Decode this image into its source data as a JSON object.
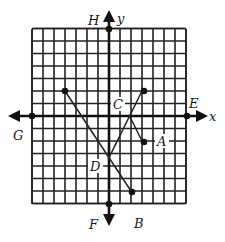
{
  "figure": {
    "type": "coordinate-grid-diagram",
    "grid": {
      "x_min": -7,
      "x_max": 7,
      "y_min": -7,
      "y_max": 7,
      "step": 1
    },
    "axes": {
      "x_label": "x",
      "y_label": "y"
    },
    "colors": {
      "ink": "#111111",
      "background": "#ffffff"
    }
  },
  "labels": {
    "H": "H",
    "y": "y",
    "G": "G",
    "x": "x",
    "E": "E",
    "C": "C",
    "A": "A",
    "D": "D",
    "F": "F",
    "B": "B"
  },
  "points": [
    {
      "name": "H",
      "x": 0,
      "y": 7
    },
    {
      "name": "F",
      "x": 0,
      "y": -7
    },
    {
      "name": "G",
      "x": -7,
      "y": 0
    },
    {
      "name": "E",
      "x": 7,
      "y": 0
    },
    {
      "name": "upper-left",
      "x": -4,
      "y": 2
    },
    {
      "name": "upper-right",
      "x": 3,
      "y": 2
    },
    {
      "name": "A",
      "x": 3,
      "y": -2
    },
    {
      "name": "B",
      "x": 2,
      "y": -6
    }
  ],
  "segments": [
    {
      "from": [
        -4,
        2
      ],
      "to": [
        2,
        -6
      ]
    },
    {
      "from": [
        3,
        2
      ],
      "to": [
        0,
        -3.33
      ]
    },
    {
      "from": [
        1.875,
        0
      ],
      "to": [
        3,
        -2
      ]
    }
  ]
}
